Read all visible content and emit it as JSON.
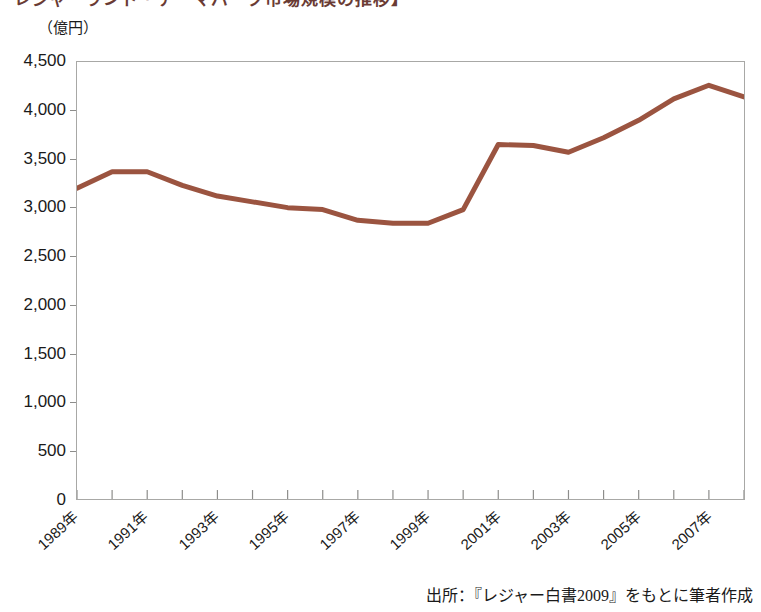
{
  "figure": {
    "title_clipped": "レジャーランド・テーマパーク市場規模の推移】",
    "unit_label": "（億円）",
    "source_note": "出所：『レジャー白書2009』をもとに筆者作成"
  },
  "chart_data": {
    "type": "line",
    "title": "レジャーランド・テーマパーク市場規模の推移",
    "xlabel": "",
    "ylabel": "",
    "unit": "億円",
    "grid": false,
    "legend": false,
    "line_color": "#9b5440",
    "ylim": [
      0,
      4500
    ],
    "yticks": [
      0,
      500,
      1000,
      1500,
      2000,
      2500,
      3000,
      3500,
      4000,
      4500
    ],
    "ytick_labels": [
      "0",
      "500",
      "1,000",
      "1,500",
      "2,000",
      "2,500",
      "3,000",
      "3,500",
      "4,000",
      "4,500"
    ],
    "categories": [
      "1989年",
      "1990年",
      "1991年",
      "1992年",
      "1993年",
      "1994年",
      "1995年",
      "1996年",
      "1997年",
      "1998年",
      "1999年",
      "2000年",
      "2001年",
      "2002年",
      "2003年",
      "2004年",
      "2005年",
      "2006年",
      "2007年",
      "2008年"
    ],
    "xtick_labels_shown": [
      "1989年",
      "1991年",
      "1993年",
      "1995年",
      "1997年",
      "1999年",
      "2001年",
      "2003年",
      "2005年",
      "2007年"
    ],
    "values": [
      3200,
      3370,
      3370,
      3230,
      3120,
      3060,
      3000,
      2980,
      2870,
      2840,
      2840,
      2980,
      3650,
      3640,
      3570,
      3720,
      3900,
      4120,
      4260,
      4140
    ]
  }
}
